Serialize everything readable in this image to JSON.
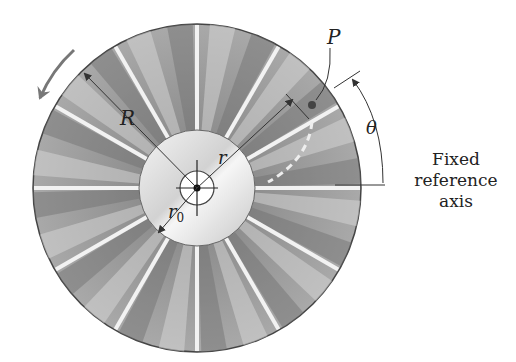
{
  "diagram": {
    "labels": {
      "R": "R",
      "r": "r",
      "r0_base": "r",
      "r0_sub": "0",
      "P": "P",
      "theta": "θ"
    },
    "caption": {
      "line1": "Fixed",
      "line2": "reference",
      "line3": "axis"
    },
    "geometry": {
      "center": [
        197,
        188
      ],
      "outer_radius": 164,
      "hub_radius": 58,
      "inner_ring_radius": 17,
      "slot_count": 12,
      "slot_spacing_deg": 30
    },
    "colors": {
      "disk_dark": "#7a7a7a",
      "disk_light": "#c8c8c8",
      "hub": "#e4e4e4",
      "slot": "#f2f2f2",
      "ink": "#333333",
      "arrow": "#777777"
    }
  }
}
